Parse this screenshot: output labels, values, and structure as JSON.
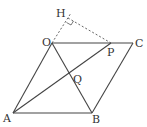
{
  "diagram": {
    "points": {
      "O": {
        "label": "O",
        "x": 52,
        "y": 43
      },
      "C": {
        "label": "C",
        "x": 133,
        "y": 43
      },
      "P": {
        "label": "P",
        "x": 111,
        "y": 43
      },
      "A": {
        "label": "A",
        "x": 13,
        "y": 113
      },
      "B": {
        "label": "B",
        "x": 92,
        "y": 113
      },
      "H": {
        "label": "H",
        "x": 69,
        "y": 16
      },
      "Q": {
        "label": "Q",
        "x": 70,
        "y": 72
      }
    },
    "labels": {
      "H": "H",
      "O": "O",
      "P": "P",
      "C": "C",
      "Q": "Q",
      "A": "A",
      "B": "B"
    },
    "line_color": "#444444",
    "dash_color": "#555555"
  }
}
